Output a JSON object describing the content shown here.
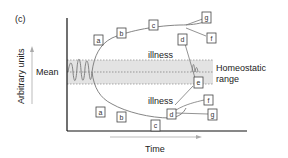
{
  "figure": {
    "panel_label": "(c)",
    "y_axis_label": "Arbitrary units",
    "x_axis_label": "Time",
    "mean_label": "Mean",
    "range_label_line1": "Homeostatic",
    "range_label_line2": "range",
    "upper_illness_label": "illness",
    "lower_illness_label": "illness"
  },
  "upper_boxes": [
    {
      "label": "a"
    },
    {
      "label": "b"
    },
    {
      "label": "c"
    },
    {
      "label": "d"
    },
    {
      "label": "g"
    },
    {
      "label": "f"
    }
  ],
  "lower_boxes": [
    {
      "label": "a"
    },
    {
      "label": "b"
    },
    {
      "label": "c"
    },
    {
      "label": "d"
    },
    {
      "label": "e"
    },
    {
      "label": "f"
    },
    {
      "label": "g"
    }
  ],
  "colors": {
    "band": "#e3e3e3",
    "curve": "#777777",
    "axis": "#111111",
    "arrow": "#aaaaaa"
  }
}
